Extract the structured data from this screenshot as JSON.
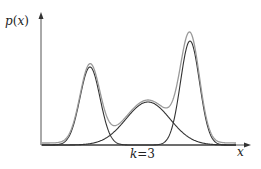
{
  "chart_data": {
    "type": "line",
    "title": "",
    "xlabel": "x",
    "ylabel": "p(x)",
    "annotation": "k=3",
    "grid": false,
    "legend": null,
    "axis": {
      "origin_px": [
        41,
        145
      ],
      "x_end_px": 250,
      "y_top_px": 14
    },
    "components": [
      {
        "name": "component-1",
        "mu_px": 90,
        "sigma_px": 10,
        "height_px": 78,
        "color": "#333333"
      },
      {
        "name": "component-2",
        "mu_px": 148,
        "sigma_px": 22,
        "height_px": 43,
        "color": "#333333"
      },
      {
        "name": "component-3",
        "mu_px": 190,
        "sigma_px": 9.5,
        "height_px": 104,
        "color": "#333333"
      }
    ],
    "mixture": {
      "name": "mixture",
      "color": "#9a9a9a"
    }
  },
  "labels": {
    "y_axis_p": "p",
    "y_axis_open": "(",
    "y_axis_x": "x",
    "y_axis_close": ")",
    "x_axis": "x",
    "k_var": "k",
    "k_eq": "=3"
  }
}
